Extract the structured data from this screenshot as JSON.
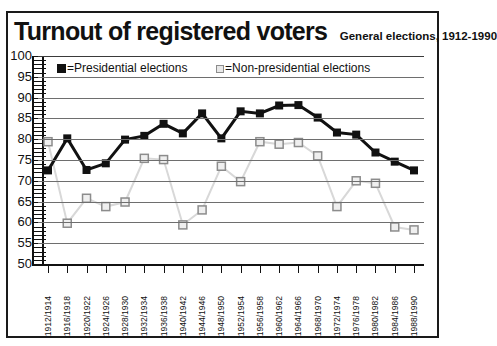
{
  "header": {
    "title": "Turnout of registered voters",
    "subtitle": "General elections, 1912-1990"
  },
  "legend": {
    "presidential": "=Presidential elections",
    "nonpresidential": "=Non-presidential elections"
  },
  "colors": {
    "presidential": "#111111",
    "nonpresidential": "#d8d8d8",
    "nonpresidential_marker_border": "#8c8c8c",
    "gridline": "#6e6e6e",
    "frame": "#1a1a1a",
    "text": "#111111"
  },
  "chart_data": {
    "type": "line",
    "title": "Turnout of registered voters",
    "subtitle": "General elections, 1912-1990",
    "xlabel": "",
    "ylabel": "",
    "ylim": [
      50,
      100
    ],
    "yticks": [
      50,
      55,
      60,
      65,
      70,
      75,
      80,
      85,
      90,
      95,
      100
    ],
    "grid": true,
    "legend_position": "top-inside",
    "categories": [
      "1912/1914",
      "1916/1918",
      "1920/1922",
      "1924/1926",
      "1928/1930",
      "1932/1934",
      "1936/1938",
      "1940/1942",
      "1944/1946",
      "1948/1950",
      "1952/1954",
      "1956/1958",
      "1960/1962",
      "1964/1966",
      "1968/1970",
      "1972/1974",
      "1976/1978",
      "1980/1982",
      "1984/1986",
      "1988/1990"
    ],
    "series": [
      {
        "name": "Presidential elections",
        "marker": "filled-square",
        "color": "#111111",
        "values": [
          72.5,
          80.2,
          72.6,
          74.2,
          79.9,
          80.8,
          83.7,
          81.4,
          86.2,
          80.2,
          86.7,
          86.2,
          88.1,
          88.2,
          85.2,
          81.6,
          81.1,
          76.8,
          74.6,
          72.5
        ]
      },
      {
        "name": "Non-presidential elections",
        "marker": "open-square",
        "color": "#d8d8d8",
        "values": [
          79.4,
          59.8,
          65.8,
          63.8,
          64.9,
          75.4,
          75.1,
          59.4,
          63.0,
          73.5,
          69.8,
          79.4,
          78.8,
          79.2,
          76.0,
          63.8,
          70.0,
          69.4,
          58.9,
          58.2
        ]
      }
    ]
  }
}
